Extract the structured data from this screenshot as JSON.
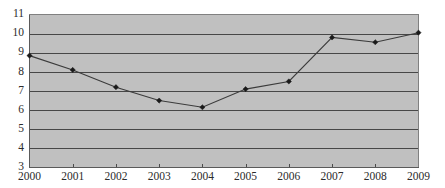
{
  "chart_data": {
    "type": "line",
    "title": "",
    "subtitle": "",
    "xlabel": "",
    "ylabel": "",
    "categories": [
      "2000",
      "2001",
      "2002",
      "2003",
      "2004",
      "2005",
      "2006",
      "2007",
      "2008",
      "2009"
    ],
    "values": [
      8.85,
      8.1,
      7.2,
      6.5,
      6.15,
      7.1,
      7.5,
      9.8,
      9.55,
      10.05
    ],
    "series": [
      {
        "name": "",
        "values": [
          8.85,
          8.1,
          7.2,
          6.5,
          6.15,
          7.1,
          7.5,
          9.8,
          9.55,
          10.05
        ]
      }
    ],
    "ylim": [
      3,
      11
    ],
    "xlim": [
      "2000",
      "2009"
    ],
    "ytick_labels": [
      "11",
      "10",
      "9",
      "8",
      "7",
      "6",
      "5",
      "4",
      "3"
    ],
    "ytick_values": [
      11,
      10,
      9,
      8,
      7,
      6,
      5,
      4,
      3
    ],
    "xtick_labels": [
      "2000",
      "2001",
      "2002",
      "2003",
      "2004",
      "2005",
      "2006",
      "2007",
      "2008",
      "2009"
    ],
    "grid": "horizontal",
    "legend": "none",
    "annotations": [],
    "colors": {
      "plot_background": "#c0c0c0",
      "page_background": "#ffffff",
      "gridline": "#3a3a3a",
      "series_line": "#3b3b3b",
      "marker": "#1a1a1a",
      "tick_label": "#2b2b2b",
      "plot_frame": "#808080"
    },
    "marker_style": "diamond"
  }
}
